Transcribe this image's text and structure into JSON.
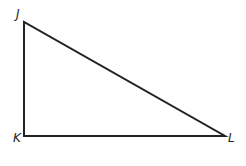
{
  "diagram": {
    "type": "right-triangle",
    "vertices": [
      {
        "label": "J",
        "x": 24,
        "y": 22
      },
      {
        "label": "K",
        "x": 24,
        "y": 136
      },
      {
        "label": "L",
        "x": 225,
        "y": 136
      }
    ],
    "right_angle_at": "K",
    "stroke_color": "#222222"
  }
}
